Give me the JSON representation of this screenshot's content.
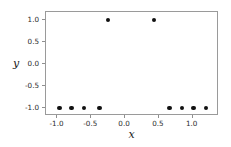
{
  "chart_data": {
    "type": "scatter",
    "title": "",
    "xlabel": "x",
    "ylabel": "y",
    "xlim": [
      -1.17,
      1.39
    ],
    "ylim": [
      -1.18,
      1.18
    ],
    "grid": false,
    "legend": null,
    "marker": {
      "shape": "circle",
      "color": "#111111",
      "size_px": 4.4
    },
    "frame_color": "#9a9a9a",
    "xticks": [
      -1.0,
      -0.5,
      0.0,
      0.5,
      1.0
    ],
    "xticklabels": [
      "-1.0",
      "-0.5",
      "0.0",
      "0.5",
      "1.0"
    ],
    "yticks": [
      1.0,
      0.5,
      0.0,
      -0.5,
      -1.0
    ],
    "yticklabels": [
      "1.0",
      "0.5",
      "0.0",
      "-0.5",
      "-1.0"
    ],
    "series": [
      {
        "name": "data",
        "points": [
          {
            "x": -0.97,
            "y": -1.0
          },
          {
            "x": -0.79,
            "y": -1.0
          },
          {
            "x": -0.61,
            "y": -1.0
          },
          {
            "x": -0.38,
            "y": -1.0
          },
          {
            "x": -0.25,
            "y": 1.0
          },
          {
            "x": 0.43,
            "y": 1.0
          },
          {
            "x": 0.66,
            "y": -1.0
          },
          {
            "x": 0.84,
            "y": -1.0
          },
          {
            "x": 1.01,
            "y": -1.0
          },
          {
            "x": 1.2,
            "y": -1.0
          }
        ]
      }
    ]
  }
}
